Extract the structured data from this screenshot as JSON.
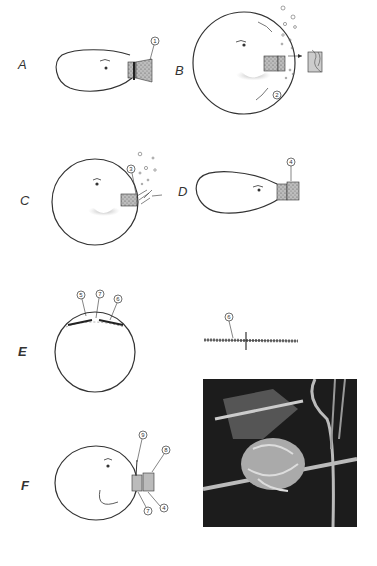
{
  "figure": {
    "panels": [
      {
        "id": "A",
        "label": "A",
        "callouts": [
          "1"
        ]
      },
      {
        "id": "B",
        "label": "B",
        "callouts": [
          "2"
        ]
      },
      {
        "id": "C",
        "label": "C",
        "callouts": [
          "3"
        ]
      },
      {
        "id": "D",
        "label": "D",
        "callouts": [
          "4"
        ]
      },
      {
        "id": "E",
        "label": "E",
        "callouts": [
          "5",
          "7",
          "6"
        ],
        "detail_callout": "6"
      },
      {
        "id": "F",
        "label": "F",
        "callouts": [
          "9",
          "8",
          "7",
          "4"
        ]
      }
    ],
    "photo": {
      "description": "photograph of tied bundle with strings"
    },
    "colors": {
      "ink": "#333333",
      "background": "#ffffff",
      "photo_bg": "#1a1a1a"
    }
  }
}
